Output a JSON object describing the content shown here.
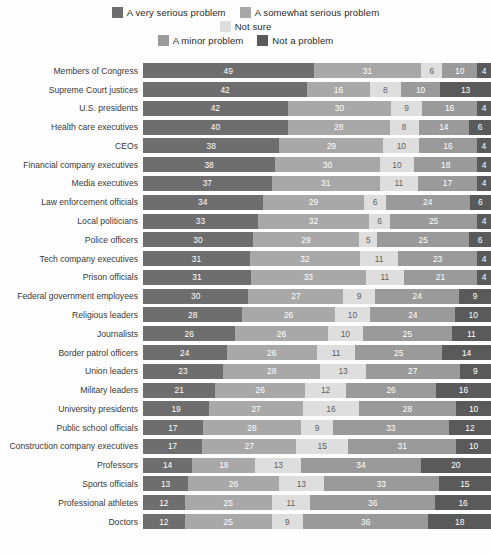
{
  "legend": {
    "rows": [
      [
        {
          "label": "A very serious problem",
          "color": "#6e6e6e",
          "key": "very_serious"
        },
        {
          "label": "A somewhat serious problem",
          "color": "#a8a8a8",
          "key": "somewhat_serious"
        }
      ],
      [
        {
          "label": "Not sure",
          "color": "#dedede",
          "key": "not_sure"
        }
      ],
      [
        {
          "label": "A minor problem",
          "color": "#9a9a9a",
          "key": "minor"
        },
        {
          "label": "Not a problem",
          "color": "#5a5a5a",
          "key": "not_a_problem"
        }
      ]
    ]
  },
  "chart_data": {
    "type": "bar",
    "subtype": "stacked-horizontal-100",
    "title": "",
    "xlabel": "",
    "ylabel": "",
    "xlim": [
      0,
      100
    ],
    "grid": false,
    "legend_position": "top",
    "value_unit": "%",
    "series": [
      {
        "name": "A very serious problem",
        "color": "#6e6e6e"
      },
      {
        "name": "A somewhat serious problem",
        "color": "#a8a8a8"
      },
      {
        "name": "Not sure",
        "color": "#dedede"
      },
      {
        "name": "A minor problem",
        "color": "#9a9a9a"
      },
      {
        "name": "Not a problem",
        "color": "#5a5a5a"
      }
    ],
    "categories": [
      "Members of Congress",
      "Supreme Court justices",
      "U.S. presidents",
      "Health care executives",
      "CEOs",
      "Financial company executives",
      "Media executives",
      "Law enforcement officials",
      "Local politicians",
      "Police officers",
      "Tech company executives",
      "Prison officials",
      "Federal government employees",
      "Religious leaders",
      "Journalists",
      "Border patrol officers",
      "Union leaders",
      "Military leaders",
      "University presidents",
      "Public school officials",
      "Construction company executives",
      "Professors",
      "Sports officials",
      "Professional athletes",
      "Doctors"
    ],
    "rows": [
      {
        "category": "Members of Congress",
        "values": [
          49,
          31,
          6,
          10,
          4
        ]
      },
      {
        "category": "Supreme Court justices",
        "values": [
          42,
          16,
          8,
          10,
          13
        ]
      },
      {
        "category": "U.S. presidents",
        "values": [
          42,
          30,
          9,
          16,
          4
        ]
      },
      {
        "category": "Health care executives",
        "values": [
          40,
          28,
          8,
          14,
          6
        ]
      },
      {
        "category": "CEOs",
        "values": [
          38,
          29,
          10,
          16,
          4
        ]
      },
      {
        "category": "Financial company executives",
        "values": [
          38,
          30,
          10,
          18,
          4
        ]
      },
      {
        "category": "Media executives",
        "values": [
          37,
          31,
          11,
          17,
          4
        ]
      },
      {
        "category": "Law enforcement officials",
        "values": [
          34,
          29,
          6,
          24,
          6
        ]
      },
      {
        "category": "Local politicians",
        "values": [
          33,
          32,
          6,
          25,
          4
        ]
      },
      {
        "category": "Police officers",
        "values": [
          30,
          29,
          5,
          25,
          6
        ]
      },
      {
        "category": "Tech company executives",
        "values": [
          31,
          32,
          11,
          23,
          4
        ]
      },
      {
        "category": "Prison officials",
        "values": [
          31,
          33,
          11,
          21,
          4
        ]
      },
      {
        "category": "Federal government employees",
        "values": [
          30,
          27,
          9,
          24,
          9
        ]
      },
      {
        "category": "Religious leaders",
        "values": [
          28,
          26,
          10,
          24,
          10
        ]
      },
      {
        "category": "Journalists",
        "values": [
          26,
          26,
          10,
          25,
          11
        ]
      },
      {
        "category": "Border patrol officers",
        "values": [
          24,
          26,
          11,
          25,
          14
        ]
      },
      {
        "category": "Union leaders",
        "values": [
          23,
          28,
          13,
          27,
          9
        ]
      },
      {
        "category": "Military leaders",
        "values": [
          21,
          26,
          12,
          26,
          16
        ]
      },
      {
        "category": "University presidents",
        "values": [
          19,
          27,
          16,
          28,
          10
        ]
      },
      {
        "category": "Public school officials",
        "values": [
          17,
          28,
          9,
          33,
          12
        ]
      },
      {
        "category": "Construction company executives",
        "values": [
          17,
          27,
          15,
          31,
          10
        ]
      },
      {
        "category": "Professors",
        "values": [
          14,
          18,
          13,
          34,
          20
        ]
      },
      {
        "category": "Sports officials",
        "values": [
          13,
          26,
          13,
          33,
          15
        ]
      },
      {
        "category": "Professional athletes",
        "values": [
          12,
          25,
          11,
          36,
          16
        ]
      },
      {
        "category": "Doctors",
        "values": [
          12,
          25,
          9,
          36,
          18
        ]
      }
    ]
  }
}
